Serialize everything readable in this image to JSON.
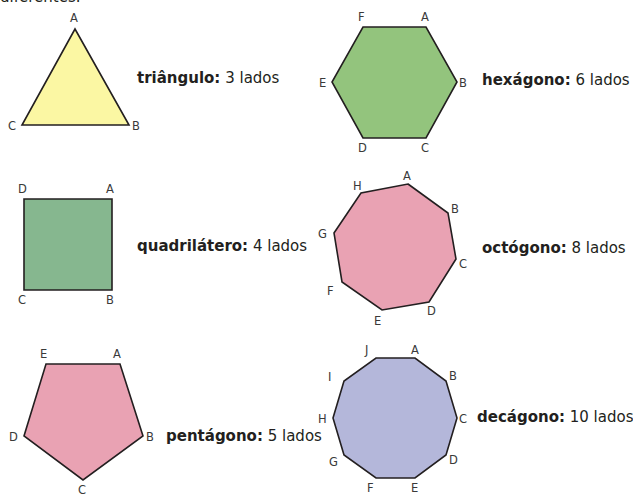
{
  "header": {
    "partial_text": "diferentes."
  },
  "colors": {
    "stroke": "#231f20",
    "triangle": "#fbf7a3",
    "square": "#86b78f",
    "pentagon": "#e9a2b3",
    "hexagon": "#93c47d",
    "octagon": "#e9a2b3",
    "decagon": "#b4b7da"
  },
  "shapes": [
    {
      "id": "triangle",
      "name": "triângulo:",
      "sides_text": "3 lados",
      "points": [
        [
          75,
          29
        ],
        [
          129,
          125
        ],
        [
          22,
          125
        ]
      ],
      "labels": [
        {
          "t": "A",
          "x": 70,
          "y": 22
        },
        {
          "t": "B",
          "x": 132,
          "y": 130
        },
        {
          "t": "C",
          "x": 8,
          "y": 130
        }
      ]
    },
    {
      "id": "square",
      "name": "quadrilátero:",
      "sides_text": "4 lados",
      "points": [
        [
          24,
          199
        ],
        [
          112,
          199
        ],
        [
          112,
          290
        ],
        [
          24,
          290
        ]
      ],
      "labels": [
        {
          "t": "D",
          "x": 18,
          "y": 193
        },
        {
          "t": "A",
          "x": 106,
          "y": 193
        },
        {
          "t": "C",
          "x": 18,
          "y": 304
        },
        {
          "t": "B",
          "x": 106,
          "y": 304
        }
      ]
    },
    {
      "id": "pentagon",
      "name": "pentágono:",
      "sides_text": "5 lados",
      "points": [
        [
          46,
          364
        ],
        [
          120,
          364
        ],
        [
          143,
          436
        ],
        [
          83,
          480
        ],
        [
          24,
          436
        ]
      ],
      "labels": [
        {
          "t": "E",
          "x": 40,
          "y": 358
        },
        {
          "t": "A",
          "x": 113,
          "y": 358
        },
        {
          "t": "B",
          "x": 146,
          "y": 441
        },
        {
          "t": "C",
          "x": 78,
          "y": 494
        },
        {
          "t": "D",
          "x": 9,
          "y": 441
        }
      ]
    },
    {
      "id": "hexagon",
      "name": "hexágono:",
      "sides_text": "6 lados",
      "points": [
        [
          363,
          27
        ],
        [
          426,
          27
        ],
        [
          457,
          82
        ],
        [
          426,
          138
        ],
        [
          363,
          138
        ],
        [
          332,
          82
        ]
      ],
      "labels": [
        {
          "t": "F",
          "x": 358,
          "y": 21
        },
        {
          "t": "A",
          "x": 421,
          "y": 21
        },
        {
          "t": "B",
          "x": 459,
          "y": 87
        },
        {
          "t": "C",
          "x": 421,
          "y": 152
        },
        {
          "t": "D",
          "x": 358,
          "y": 152
        },
        {
          "t": "E",
          "x": 319,
          "y": 87
        }
      ]
    },
    {
      "id": "octagon",
      "name": "octógono:",
      "sides_text": "8 lados",
      "points": [
        [
          408,
          184
        ],
        [
          448,
          213
        ],
        [
          456,
          259
        ],
        [
          429,
          302
        ],
        [
          382,
          310
        ],
        [
          342,
          282
        ],
        [
          334,
          233
        ],
        [
          361,
          193
        ]
      ],
      "labels": [
        {
          "t": "A",
          "x": 403,
          "y": 180
        },
        {
          "t": "B",
          "x": 451,
          "y": 213
        },
        {
          "t": "C",
          "x": 459,
          "y": 268
        },
        {
          "t": "D",
          "x": 427,
          "y": 315
        },
        {
          "t": "E",
          "x": 374,
          "y": 325
        },
        {
          "t": "F",
          "x": 327,
          "y": 295
        },
        {
          "t": "G",
          "x": 318,
          "y": 238
        },
        {
          "t": "H",
          "x": 353,
          "y": 190
        }
      ]
    },
    {
      "id": "decagon",
      "name": "decágono:",
      "sides_text": "10 lados",
      "points": [
        [
          376,
          358
        ],
        [
          415,
          358
        ],
        [
          446,
          381
        ],
        [
          457,
          418
        ],
        [
          446,
          455
        ],
        [
          415,
          478
        ],
        [
          376,
          478
        ],
        [
          344,
          455
        ],
        [
          333,
          418
        ],
        [
          344,
          381
        ]
      ],
      "labels": [
        {
          "t": "J",
          "x": 365,
          "y": 354
        },
        {
          "t": "A",
          "x": 411,
          "y": 354
        },
        {
          "t": "B",
          "x": 449,
          "y": 380
        },
        {
          "t": "C",
          "x": 459,
          "y": 423
        },
        {
          "t": "D",
          "x": 449,
          "y": 464
        },
        {
          "t": "E",
          "x": 411,
          "y": 492
        },
        {
          "t": "F",
          "x": 367,
          "y": 492
        },
        {
          "t": "G",
          "x": 329,
          "y": 466
        },
        {
          "t": "H",
          "x": 318,
          "y": 423
        },
        {
          "t": "I",
          "x": 328,
          "y": 381
        }
      ]
    }
  ],
  "captions": [
    {
      "id": "triangle",
      "x": 137,
      "y": 69
    },
    {
      "id": "square",
      "x": 137,
      "y": 237
    },
    {
      "id": "pentagon",
      "x": 166,
      "y": 427
    },
    {
      "id": "hexagon",
      "x": 482,
      "y": 71
    },
    {
      "id": "octagon",
      "x": 482,
      "y": 239
    },
    {
      "id": "decagon",
      "x": 477,
      "y": 408
    }
  ]
}
